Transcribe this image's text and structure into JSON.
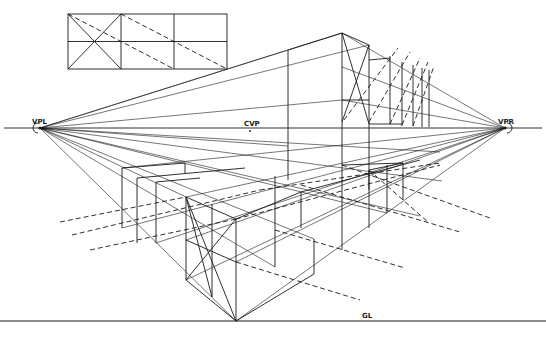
{
  "diagram": {
    "labels": {
      "vanishing_point_left": "VPL",
      "vanishing_point_right": "VPR",
      "center_vanishing_point": "CVP",
      "ground_line": "GL"
    },
    "colors": {
      "ink": "#1a1a1a",
      "background": "#ffffff"
    },
    "reference_grid": {
      "columns": 3,
      "rows": 2,
      "note": "Plan view grid with diagonal and dashed subdivision lines"
    }
  }
}
